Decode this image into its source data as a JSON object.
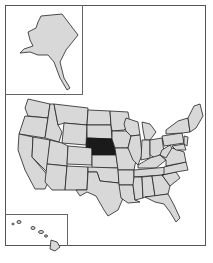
{
  "map": {
    "title": "United States locator map",
    "highlighted_state": "Nebraska",
    "colors": {
      "state_fill": "#d8d8d8",
      "highlight_fill": "#1a1a1a",
      "border": "#222222",
      "background": "#ffffff"
    },
    "insets": [
      "Alaska",
      "Hawaii"
    ]
  },
  "caption": {
    "text": ""
  }
}
